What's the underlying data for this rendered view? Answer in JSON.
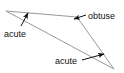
{
  "diagram": {
    "type": "geometry-angle-diagram",
    "background_color": "#ffffff",
    "shape": {
      "name": "triangle",
      "stroke_color": "#999999",
      "stroke_width": 1,
      "fill": "none",
      "vertices": [
        {
          "id": "left",
          "x": 6,
          "y": 11
        },
        {
          "id": "top-right",
          "x": 77,
          "y": 17
        },
        {
          "id": "bottom-right",
          "x": 114,
          "y": 69
        }
      ]
    },
    "annotation_color": "#111111",
    "annotations": [
      {
        "id": "acute-left",
        "label": "acute",
        "text_x": 4,
        "text_y": 37,
        "anchor": "start",
        "leader": {
          "x1": 21,
          "y1": 26,
          "x2": 28,
          "y2": 13
        },
        "arrow_at": "end"
      },
      {
        "id": "obtuse-top",
        "label": "obtuse",
        "text_x": 88,
        "text_y": 19,
        "anchor": "start",
        "leader": {
          "x1": 86,
          "y1": 15,
          "x2": 74,
          "y2": 19
        },
        "arrow_at": "end"
      },
      {
        "id": "acute-bottom",
        "label": "acute",
        "text_x": 55,
        "text_y": 64,
        "anchor": "start",
        "leader": {
          "x1": 82,
          "y1": 60,
          "x2": 104,
          "y2": 54
        },
        "arrow_at": "end"
      }
    ]
  }
}
